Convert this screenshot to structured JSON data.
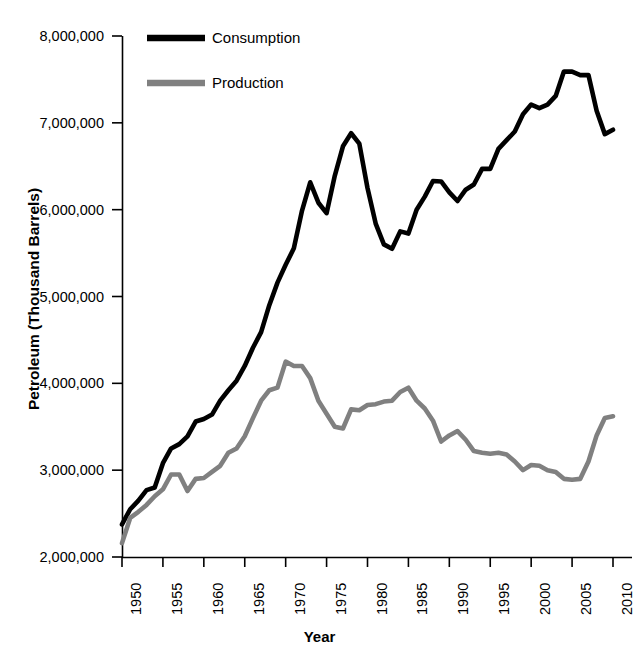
{
  "chart_data": {
    "type": "line",
    "title": "",
    "xlabel": "Year",
    "ylabel": "Petroleum (Thousand Barrels)",
    "xlim": [
      1950,
      2011
    ],
    "ylim": [
      2000000,
      8000000
    ],
    "grid": false,
    "legend_position": "top-center",
    "ytick_labels": [
      "8,000,000",
      "7,000,000",
      "6,000,000",
      "5,000,000",
      "4,000,000",
      "3,000,000",
      "2,000,000"
    ],
    "ytick_values": [
      8000000,
      7000000,
      6000000,
      5000000,
      4000000,
      3000000,
      2000000
    ],
    "xtick_labels": [
      "1950",
      "1955",
      "1960",
      "1965",
      "1970",
      "1975",
      "1980",
      "1985",
      "1990",
      "1995",
      "2000",
      "2005",
      "2010"
    ],
    "xtick_values": [
      1950,
      1955,
      1960,
      1965,
      1970,
      1975,
      1980,
      1985,
      1990,
      1995,
      2000,
      2005,
      2010
    ],
    "x": [
      1950,
      1951,
      1952,
      1953,
      1954,
      1955,
      1956,
      1957,
      1958,
      1959,
      1960,
      1961,
      1962,
      1963,
      1964,
      1965,
      1966,
      1967,
      1968,
      1969,
      1970,
      1971,
      1972,
      1973,
      1974,
      1975,
      1976,
      1977,
      1978,
      1979,
      1980,
      1981,
      1982,
      1983,
      1984,
      1985,
      1986,
      1987,
      1988,
      1989,
      1990,
      1991,
      1992,
      1993,
      1994,
      1995,
      1996,
      1997,
      1998,
      1999,
      2000,
      2001,
      2002,
      2003,
      2004,
      2005,
      2006,
      2007,
      2008,
      2009,
      2010
    ],
    "series": [
      {
        "name": "Consumption",
        "color": "#000000",
        "values": [
          2375000,
          2550000,
          2650000,
          2770000,
          2800000,
          3080000,
          3250000,
          3300000,
          3390000,
          3560000,
          3590000,
          3640000,
          3800000,
          3920000,
          4030000,
          4200000,
          4410000,
          4590000,
          4900000,
          5160000,
          5365000,
          5555000,
          5990000,
          6315000,
          6080000,
          5960000,
          6390000,
          6730000,
          6880000,
          6760000,
          6250000,
          5840000,
          5600000,
          5550000,
          5750000,
          5725000,
          6000000,
          6150000,
          6330000,
          6325000,
          6200000,
          6100000,
          6230000,
          6290000,
          6470000,
          6470000,
          6700000,
          6800000,
          6900000,
          7100000,
          7210000,
          7170000,
          7210000,
          7310000,
          7590000,
          7590000,
          7550000,
          7550000,
          7140000,
          6870000,
          6920000
        ]
      },
      {
        "name": "Production",
        "color": "#808080",
        "values": [
          2160000,
          2450000,
          2520000,
          2600000,
          2700000,
          2780000,
          2950000,
          2950000,
          2760000,
          2900000,
          2910000,
          2980000,
          3050000,
          3200000,
          3250000,
          3390000,
          3600000,
          3800000,
          3920000,
          3950000,
          4250000,
          4200000,
          4200000,
          4060000,
          3800000,
          3650000,
          3500000,
          3480000,
          3700000,
          3690000,
          3750000,
          3760000,
          3790000,
          3800000,
          3900000,
          3950000,
          3800000,
          3710000,
          3570000,
          3330000,
          3400000,
          3450000,
          3350000,
          3220000,
          3200000,
          3190000,
          3200000,
          3180000,
          3100000,
          3000000,
          3060000,
          3050000,
          3000000,
          2980000,
          2900000,
          2890000,
          2900000,
          3100000,
          3400000,
          3600000,
          3620000
        ]
      }
    ]
  },
  "legend": {
    "items": [
      {
        "label": "Consumption",
        "color": "#000000"
      },
      {
        "label": "Production",
        "color": "#808080"
      }
    ]
  }
}
